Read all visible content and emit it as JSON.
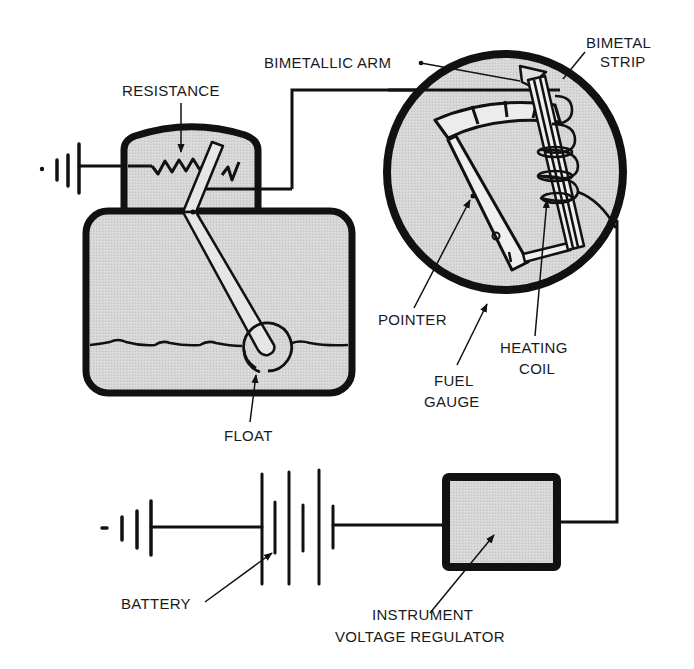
{
  "diagram": {
    "colors": {
      "ink": "#111111",
      "fill": "#d4d4d4",
      "background": "#ffffff"
    },
    "labels": {
      "resistance": "RESISTANCE",
      "bimetallic_arm": "BIMETALLIC ARM",
      "bimetal_strip_line1": "BIMETAL",
      "bimetal_strip_line2": "STRIP",
      "pointer": "POINTER",
      "heating_coil_line1": "HEATING",
      "heating_coil_line2": "COIL",
      "fuel_gauge_line1": "FUEL",
      "fuel_gauge_line2": "GAUGE",
      "float": "FLOAT",
      "battery": "BATTERY",
      "regulator_line1": "INSTRUMENT",
      "regulator_line2": "VOLTAGE REGULATOR"
    },
    "components": [
      {
        "id": "ground-top",
        "type": "ground"
      },
      {
        "id": "tank-sender",
        "type": "variable-resistor-with-float"
      },
      {
        "id": "fuel-gauge",
        "type": "bimetal-gauge"
      },
      {
        "id": "ground-bottom",
        "type": "ground"
      },
      {
        "id": "battery",
        "type": "battery"
      },
      {
        "id": "instrument-voltage-regulator",
        "type": "regulator"
      }
    ]
  }
}
